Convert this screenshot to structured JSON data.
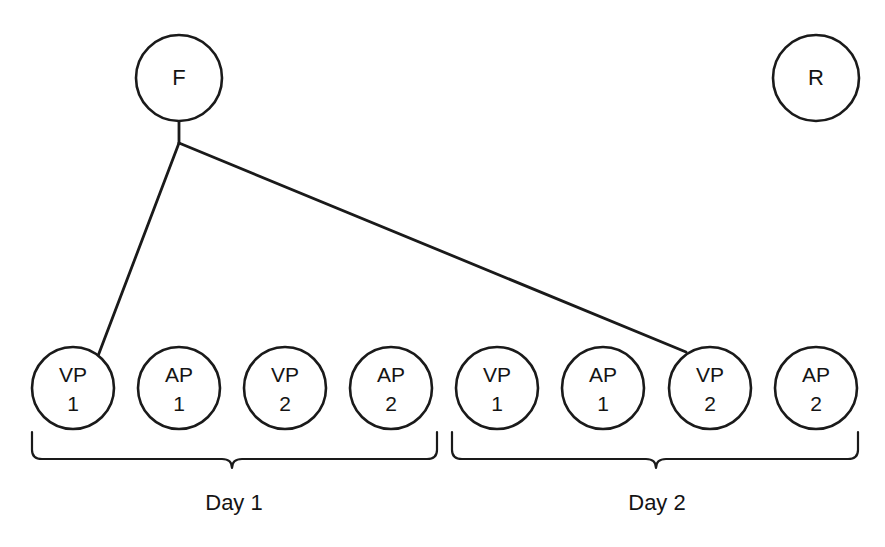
{
  "diagram": {
    "top_nodes": [
      {
        "id": "F",
        "label": "F",
        "cx": 179,
        "cy": 78,
        "r": 43
      },
      {
        "id": "R",
        "label": "R",
        "cx": 816,
        "cy": 78,
        "r": 43
      }
    ],
    "bottom_nodes": [
      {
        "id": "day1-vp1",
        "line1": "VP",
        "line2": "1",
        "cx": 73,
        "cy": 388,
        "r": 41
      },
      {
        "id": "day1-ap1",
        "line1": "AP",
        "line2": "1",
        "cx": 179,
        "cy": 388,
        "r": 41
      },
      {
        "id": "day1-vp2",
        "line1": "VP",
        "line2": "2",
        "cx": 285,
        "cy": 388,
        "r": 41
      },
      {
        "id": "day1-ap2",
        "line1": "AP",
        "line2": "2",
        "cx": 391,
        "cy": 388,
        "r": 41
      },
      {
        "id": "day2-vp1",
        "line1": "VP",
        "line2": "1",
        "cx": 497,
        "cy": 388,
        "r": 41
      },
      {
        "id": "day2-ap1",
        "line1": "AP",
        "line2": "1",
        "cx": 603,
        "cy": 388,
        "r": 41
      },
      {
        "id": "day2-vp2",
        "line1": "VP",
        "line2": "2",
        "cx": 710,
        "cy": 388,
        "r": 41
      },
      {
        "id": "day2-ap2",
        "line1": "AP",
        "line2": "2",
        "cx": 816,
        "cy": 388,
        "r": 41
      }
    ],
    "connectors": {
      "stem": "M 179 121 L 179 143",
      "branch_left": "M 179 143 L 98 356",
      "branch_right": "M 179 143 L 686 352"
    },
    "braces": [
      {
        "id": "day1-brace",
        "label": "Day 1",
        "path": "M 32 432 L 32 450 Q 32 459 42 459 L 222 459 Q 232 459 232 468 Q 232 459 242 459 L 427 459 Q 437 459 437 450 L 437 432",
        "label_x": 234,
        "label_y": 504
      },
      {
        "id": "day2-brace",
        "label": "Day 2",
        "path": "M 452 432 L 452 450 Q 452 459 462 459 L 646 459 Q 656 459 656 468 Q 656 459 666 459 L 848 459 Q 858 459 858 450 L 858 432",
        "label_x": 657,
        "label_y": 504
      }
    ],
    "colors": {
      "stroke": "#1a1a1a",
      "text": "#141414",
      "background": "#ffffff"
    }
  }
}
